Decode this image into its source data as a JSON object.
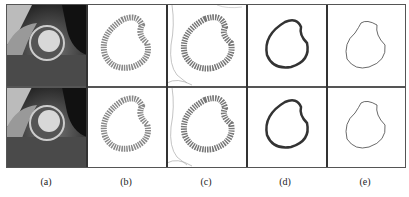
{
  "figure": {
    "rows": 2,
    "columns": [
      {
        "id": "a",
        "label": "(a)",
        "content": "cardiac-mri-image"
      },
      {
        "id": "b",
        "label": "(b)",
        "content": "myocardium-speckle-ring"
      },
      {
        "id": "c",
        "label": "(c)",
        "content": "myocardium-ring-with-edges"
      },
      {
        "id": "d",
        "label": "(d)",
        "content": "thick-contour"
      },
      {
        "id": "e",
        "label": "(e)",
        "content": "thin-contour"
      }
    ]
  }
}
